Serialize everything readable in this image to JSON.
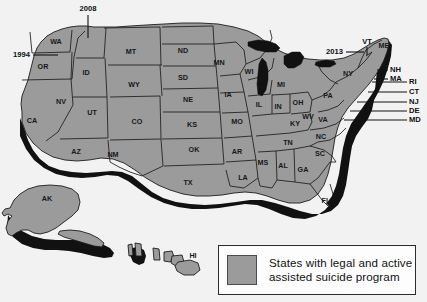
{
  "background_color": "#f2f2f2",
  "map": {
    "state_fill": "#9b9b9b",
    "outline_color": "#1c1c1c",
    "shadow_color": "#111111",
    "state_labels": [
      {
        "code": "WA",
        "x": 56,
        "y": 42
      },
      {
        "code": "OR",
        "x": 43,
        "y": 67
      },
      {
        "code": "CA",
        "x": 32,
        "y": 121
      },
      {
        "code": "NV",
        "x": 61,
        "y": 102
      },
      {
        "code": "ID",
        "x": 86,
        "y": 73
      },
      {
        "code": "UT",
        "x": 92,
        "y": 113
      },
      {
        "code": "AZ",
        "x": 76,
        "y": 152
      },
      {
        "code": "MT",
        "x": 131,
        "y": 52
      },
      {
        "code": "WY",
        "x": 134,
        "y": 85
      },
      {
        "code": "CO",
        "x": 137,
        "y": 122
      },
      {
        "code": "NM",
        "x": 113,
        "y": 155
      },
      {
        "code": "ND",
        "x": 183,
        "y": 51
      },
      {
        "code": "SD",
        "x": 183,
        "y": 78
      },
      {
        "code": "NE",
        "x": 188,
        "y": 100
      },
      {
        "code": "KS",
        "x": 192,
        "y": 125
      },
      {
        "code": "OK",
        "x": 194,
        "y": 150
      },
      {
        "code": "TX",
        "x": 188,
        "y": 183
      },
      {
        "code": "MN",
        "x": 219,
        "y": 63
      },
      {
        "code": "IA",
        "x": 228,
        "y": 95
      },
      {
        "code": "MO",
        "x": 237,
        "y": 122
      },
      {
        "code": "AR",
        "x": 237,
        "y": 152
      },
      {
        "code": "LA",
        "x": 243,
        "y": 178
      },
      {
        "code": "WI",
        "x": 249,
        "y": 72
      },
      {
        "code": "IL",
        "x": 259,
        "y": 105
      },
      {
        "code": "MI",
        "x": 281,
        "y": 85
      },
      {
        "code": "IN",
        "x": 278,
        "y": 107
      },
      {
        "code": "OH",
        "x": 298,
        "y": 103
      },
      {
        "code": "KY",
        "x": 295,
        "y": 124
      },
      {
        "code": "TN",
        "x": 288,
        "y": 143
      },
      {
        "code": "MS",
        "x": 263,
        "y": 163
      },
      {
        "code": "AL",
        "x": 283,
        "y": 166
      },
      {
        "code": "GA",
        "x": 303,
        "y": 170
      },
      {
        "code": "FL",
        "x": 326,
        "y": 201
      },
      {
        "code": "SC",
        "x": 320,
        "y": 154
      },
      {
        "code": "NC",
        "x": 321,
        "y": 137
      },
      {
        "code": "VA",
        "x": 323,
        "y": 120
      },
      {
        "code": "WV",
        "x": 308,
        "y": 117
      },
      {
        "code": "PA",
        "x": 328,
        "y": 96
      },
      {
        "code": "NY",
        "x": 348,
        "y": 74
      },
      {
        "code": "ME",
        "x": 384,
        "y": 46
      },
      {
        "code": "AK",
        "x": 47,
        "y": 199
      },
      {
        "code": "HI",
        "x": 193,
        "y": 256
      }
    ],
    "callouts": [
      {
        "id": "callout-2008",
        "text": "2008",
        "text_x": 88,
        "text_y": 9,
        "anchor": "middle",
        "path": "M 88 15 L 88 38"
      },
      {
        "id": "callout-1994",
        "text": "1994",
        "text_x": 30,
        "text_y": 55,
        "anchor": "end",
        "path": "M 33 55 L 58 55"
      },
      {
        "id": "callout-2013",
        "text": "2013",
        "text_x": 343,
        "text_y": 52,
        "anchor": "end",
        "path": "M 346 52 L 364 52"
      }
    ],
    "small_state_callouts": [
      {
        "code": "VT",
        "text_x": 367,
        "text_y": 42,
        "anchor": "middle",
        "path": "M 367 47 L 367 55"
      },
      {
        "code": "NH",
        "text_x": 390,
        "text_y": 70,
        "anchor": "start",
        "path": "M 377 70 L 388 70"
      },
      {
        "code": "MA",
        "text_x": 390,
        "text_y": 79,
        "anchor": "start",
        "path": "M 374 79 L 388 79"
      },
      {
        "code": "RI",
        "text_x": 409,
        "text_y": 82,
        "anchor": "start",
        "path": "M 372 82 L 407 82"
      },
      {
        "code": "CT",
        "text_x": 409,
        "text_y": 92,
        "anchor": "start",
        "path": "M 368 92 L 407 92"
      },
      {
        "code": "NJ",
        "text_x": 409,
        "text_y": 102,
        "anchor": "start",
        "path": "M 357 102 L 407 102"
      },
      {
        "code": "DE",
        "text_x": 409,
        "text_y": 111,
        "anchor": "start",
        "path": "M 350 111 L 407 111"
      },
      {
        "code": "MD",
        "text_x": 409,
        "text_y": 120,
        "anchor": "start",
        "path": "M 344 120 L 407 120"
      }
    ]
  },
  "legend": {
    "swatch_color": "#9b9b9b",
    "line1": "States with legal and active",
    "line2": "assisted suicide program"
  }
}
